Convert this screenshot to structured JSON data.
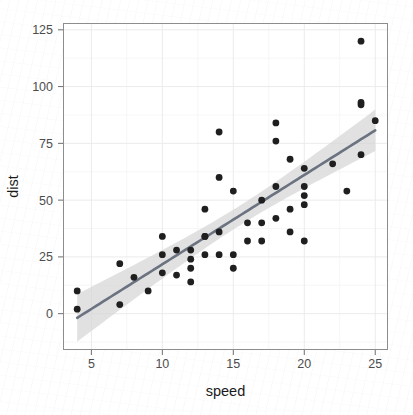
{
  "chart_data": {
    "type": "scatter",
    "title": "",
    "subtitle": "",
    "xlabel": "speed",
    "ylabel": "dist",
    "xlim": [
      3.0,
      25.9
    ],
    "ylim": [
      -16,
      128
    ],
    "xticks": [
      5,
      10,
      15,
      20,
      25
    ],
    "xtick_labels": [
      "5",
      "10",
      "15",
      "20",
      "25"
    ],
    "yticks": [
      0,
      25,
      50,
      75,
      100,
      125
    ],
    "ytick_labels": [
      "0",
      "25",
      "50",
      "75",
      "100",
      "125"
    ],
    "grid": true,
    "grid_minor": true,
    "legend": "none",
    "x": [
      4,
      4,
      7,
      7,
      8,
      9,
      10,
      10,
      10,
      11,
      11,
      12,
      12,
      12,
      12,
      13,
      13,
      13,
      13,
      14,
      14,
      14,
      14,
      15,
      15,
      15,
      16,
      16,
      17,
      17,
      17,
      18,
      18,
      18,
      18,
      19,
      19,
      19,
      20,
      20,
      20,
      20,
      20,
      22,
      23,
      24,
      24,
      24,
      24,
      25
    ],
    "y": [
      2,
      10,
      4,
      22,
      16,
      10,
      18,
      26,
      34,
      17,
      28,
      14,
      20,
      24,
      28,
      26,
      34,
      34,
      46,
      26,
      36,
      60,
      80,
      20,
      26,
      54,
      32,
      40,
      32,
      40,
      50,
      42,
      56,
      76,
      84,
      36,
      46,
      68,
      32,
      48,
      52,
      56,
      64,
      66,
      54,
      70,
      92,
      93,
      120,
      85
    ],
    "series": [
      {
        "name": "observations",
        "marker": "circle",
        "color": "#1f1f1f",
        "size": 3.4
      }
    ],
    "smooth": {
      "method": "lm",
      "formula": "y ~ x",
      "line_color": "#6b7280",
      "ribbon_color": "#d6d6d6",
      "confidence_level": 0.95,
      "intercept": -17.579,
      "slope": 3.9324,
      "se_intercept": 6.7584,
      "se_slope": 0.4155,
      "n": 50,
      "x_start": 4,
      "x_end": 25
    }
  },
  "axes": {
    "x_axis_name": "speed",
    "y_axis_name": "dist"
  }
}
